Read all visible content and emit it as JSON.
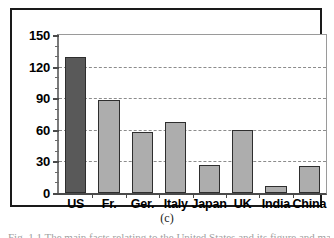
{
  "figure": {
    "subcaption": "(c)",
    "caption_cutoff": "Fig. 1.1 The main facts relating to the United States and its figure and main"
  },
  "chart_data": {
    "type": "bar",
    "title": "",
    "xlabel": "",
    "ylabel": "",
    "categories": [
      "US",
      "Fr.",
      "Ger.",
      "Italy",
      "Japan",
      "UK",
      "India",
      "China"
    ],
    "values": [
      129,
      88,
      58,
      67,
      27,
      60,
      7,
      26
    ],
    "ylim": [
      0,
      150
    ],
    "ytick_labels": [
      "0",
      "30",
      "60",
      "90",
      "120",
      "150"
    ],
    "ytick_values": [
      0,
      30,
      60,
      90,
      120,
      150
    ],
    "yminor_step": 10,
    "grid": true,
    "grid_axis": "y",
    "grid_style": "dashed",
    "legend": "none",
    "highlight_category": "US",
    "colors": {
      "bar_fill": "#adadad",
      "bar_highlight_fill": "#595959",
      "bar_edge": "#2e2e2e",
      "grid": "#8c8c8c",
      "axis": "#4a4a4a",
      "frame": "#1a1a1a",
      "background": "#ffffff",
      "text": "#000000"
    }
  }
}
